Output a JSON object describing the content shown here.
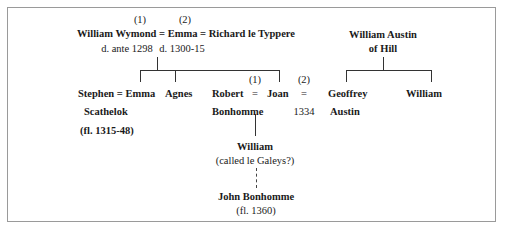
{
  "diagram": {
    "type": "family-tree",
    "generation1": {
      "marriage_marks": [
        "(1)",
        "(2)"
      ],
      "line": "William Wymond = Emma = Richard le Typpere",
      "dates": [
        "d. ante 1298",
        "d. 1300-15"
      ]
    },
    "austin": {
      "name_line1": "William Austin",
      "name_line2": "of Hill",
      "children": [
        "Geoffrey",
        "Austin",
        "William"
      ]
    },
    "generation2": {
      "stephen_line1": "Stephen = Emma",
      "stephen_line2": "Scathelok",
      "stephen_dates": "(fl. 1315-48)",
      "agnes": "Agnes",
      "robert": "Robert",
      "robert_surname": "Bonhomme",
      "equals": "=",
      "joan": "Joan",
      "mark1": "(1)",
      "mark2": "(2)",
      "second_equals": "=",
      "year": "1334"
    },
    "generation3": {
      "name": "William",
      "note": "(called le Galeys?)"
    },
    "generation4": {
      "name": "John Bonhomme",
      "dates": "(fl. 1360)"
    }
  }
}
